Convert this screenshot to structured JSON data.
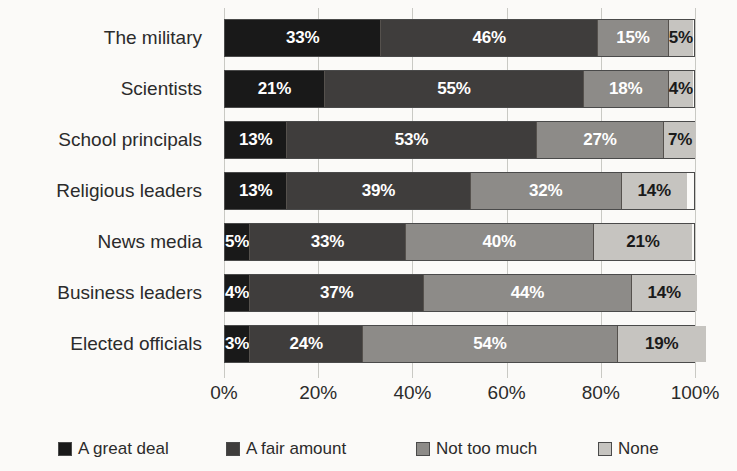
{
  "chart_data": {
    "type": "bar",
    "subtype": "stacked-horizontal-100",
    "title": "",
    "xlabel": "",
    "ylabel": "",
    "xlim": [
      0,
      100
    ],
    "xticks": [
      "0%",
      "20%",
      "40%",
      "60%",
      "80%",
      "100%"
    ],
    "xtick_values": [
      0,
      20,
      40,
      60,
      80,
      100
    ],
    "grid": true,
    "legend_position": "bottom",
    "categories": [
      "The military",
      "Scientists",
      "School principals",
      "Religious leaders",
      "News media",
      "Business leaders",
      "Elected officials"
    ],
    "series": [
      {
        "name": "A great deal",
        "color": "#191919",
        "values": [
          33,
          21,
          13,
          13,
          5,
          4,
          3
        ]
      },
      {
        "name": "A fair amount",
        "color": "#3f3d3c",
        "values": [
          46,
          55,
          53,
          39,
          33,
          37,
          24
        ]
      },
      {
        "name": "Not too much",
        "color": "#8d8b88",
        "values": [
          15,
          18,
          27,
          32,
          40,
          44,
          54
        ]
      },
      {
        "name": "None",
        "color": "#c6c4c0",
        "values": [
          5,
          4,
          7,
          14,
          21,
          14,
          19
        ]
      }
    ],
    "data_labels": [
      [
        "33%",
        "46%",
        "15%",
        "5%"
      ],
      [
        "21%",
        "55%",
        "18%",
        "4%"
      ],
      [
        "13%",
        "53%",
        "27%",
        "7%"
      ],
      [
        "13%",
        "39%",
        "32%",
        "14%"
      ],
      [
        "5%",
        "33%",
        "40%",
        "21%"
      ],
      [
        "4%",
        "37%",
        "44%",
        "14%"
      ],
      [
        "3%",
        "24%",
        "54%",
        "19%"
      ]
    ]
  },
  "legend": {
    "items": [
      {
        "label": "A great deal"
      },
      {
        "label": "A fair amount"
      },
      {
        "label": "Not too much"
      },
      {
        "label": "None"
      }
    ]
  }
}
